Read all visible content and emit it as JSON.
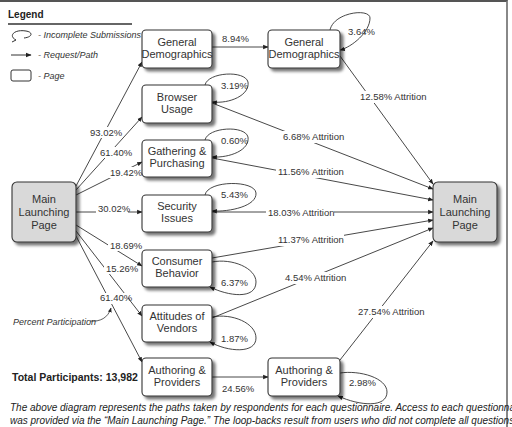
{
  "legend": {
    "title": "Legend",
    "items": [
      {
        "icon": "loop-icon",
        "label": "- Incomplete Submissions"
      },
      {
        "icon": "arrow-icon",
        "label": "- Request/Path"
      },
      {
        "icon": "page-icon",
        "label": "- Page"
      }
    ]
  },
  "nodes": {
    "main_left": [
      "Main",
      "Launching",
      "Page"
    ],
    "main_right": [
      "Main",
      "Launching",
      "Page"
    ],
    "general_demographics_1": [
      "General",
      "Demographics"
    ],
    "general_demographics_2": [
      "General",
      "Demographics"
    ],
    "browser_usage": [
      "Browser",
      "Usage"
    ],
    "gathering_purchasing": [
      "Gathering &",
      "Purchasing"
    ],
    "security_issues": [
      "Security",
      "Issues"
    ],
    "consumer_behavior": [
      "Consumer",
      "Behavior"
    ],
    "attitudes_vendors": [
      "Attitudes of",
      "Vendors"
    ],
    "authoring_providers_1": [
      "Authoring &",
      "Providers"
    ],
    "authoring_providers_2": [
      "Authoring &",
      "Providers"
    ]
  },
  "participation": {
    "general_demographics": "93.02%",
    "browser_usage": "61.40%",
    "gathering_purchasing": "19.42%",
    "security_issues": "30.02%",
    "consumer_behavior": "18.69%",
    "attitudes_vendors": "15.26%",
    "authoring_providers": "61.40%"
  },
  "continuation": {
    "general_demographics": "8.94%",
    "authoring_providers": "24.56%"
  },
  "incomplete": {
    "general_demographics_2": "3.64%",
    "browser_usage": "3.19%",
    "gathering_purchasing": "0.60%",
    "security_issues": "5.43%",
    "consumer_behavior": "6.37%",
    "attitudes_vendors": "1.87%",
    "authoring_providers_2": "2.98%"
  },
  "attrition": {
    "general_demographics": "12.58% Attrition",
    "browser_usage": "6.68% Attrition",
    "gathering_purchasing": "11.56% Attrition",
    "security_issues": "18.03% Attrition",
    "consumer_behavior": "11.37% Attrition",
    "attitudes_vendors": "4.54% Attrition",
    "authoring_providers": "27.54% Attrition"
  },
  "annotation": "Percent Participation",
  "total_participants": "Total Participants: 13,982",
  "caption": {
    "line1": "The above diagram represents the paths taken by respondents for each questionnaire.  Access to each questionnaire",
    "line2": "was provided via the “Main Launching Page.” The loop-backs result from users who did not complete all questions"
  },
  "colors": {
    "main_box_fill": "#d9d9d9",
    "page_box_fill": "#ffffff",
    "stroke": "#333333",
    "shadow": "#9a9a9a"
  }
}
